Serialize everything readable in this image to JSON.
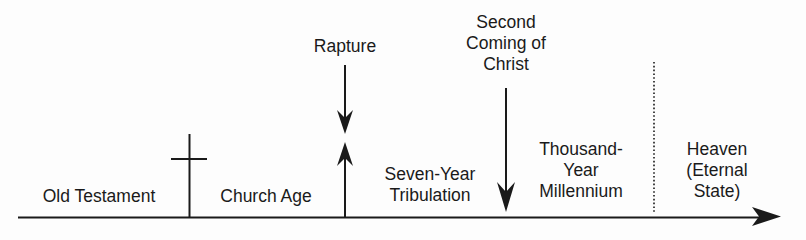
{
  "diagram": {
    "type": "timeline",
    "colors": {
      "ink": "#1a1a1a",
      "background": "#fdfdfd"
    },
    "periods": [
      {
        "id": "old-testament",
        "label": "Old Testament"
      },
      {
        "id": "church-age",
        "label": "Church Age"
      },
      {
        "id": "tribulation",
        "label": "Seven-Year\nTribulation"
      },
      {
        "id": "millennium",
        "label": "Thousand-\nYear\nMillennium"
      },
      {
        "id": "heaven",
        "label": "Heaven\n(Eternal\nState)"
      }
    ],
    "events": [
      {
        "id": "cross",
        "icon": "cross-icon"
      },
      {
        "id": "rapture",
        "label": "Rapture",
        "icon": "down-and-up-arrows"
      },
      {
        "id": "second-coming",
        "label": "Second\nComing of\nChrist",
        "icon": "down-arrow"
      }
    ],
    "divider": {
      "style": "dotted",
      "between": [
        "millennium",
        "heaven"
      ]
    }
  }
}
